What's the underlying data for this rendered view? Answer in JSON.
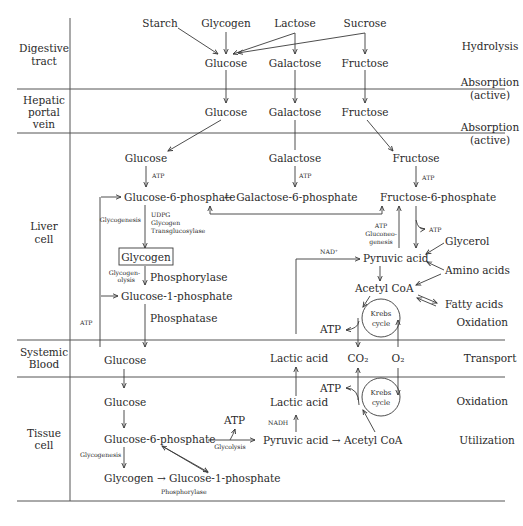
{
  "rows": {
    "digestive": [
      "Digestive",
      "tract"
    ],
    "hepatic": [
      "Hepatic",
      "portal",
      "vein"
    ],
    "liver": [
      "Liver",
      "cell"
    ],
    "blood": [
      "Systemic",
      "Blood"
    ],
    "tissue": [
      "Tissue",
      "cell"
    ]
  },
  "processes": {
    "hydrolysis": "Hydrolysis",
    "absorption1": [
      "Absorption",
      "(active)"
    ],
    "absorption2": [
      "Absorption",
      "(active)"
    ],
    "oxidation_liver": "Oxidation",
    "transport": "Transport",
    "oxidation_tissue": "Oxidation",
    "utilization": "Utilization"
  },
  "digestive": {
    "starch": "Starch",
    "glycogen": "Glycogen",
    "lactose": "Lactose",
    "sucrose": "Sucrose",
    "glucose": "Glucose",
    "galactose": "Galactose",
    "fructose": "Fructose"
  },
  "hepatic": {
    "glucose": "Glucose",
    "galactose": "Galactose",
    "fructose": "Fructose"
  },
  "liver": {
    "glucose": "Glucose",
    "galactose": "Galactose",
    "fructose": "Fructose",
    "atp1": "ATP",
    "atp2": "ATP",
    "atp3": "ATP",
    "g6p": "Glucose-6-phosphate",
    "gal6p": "← Galactose-6-phosphate",
    "f6p": "Fructose-6-phosphate",
    "glycogenesis": "Glycogenesis",
    "enzymes": [
      "UDPG",
      "Glycogen",
      "Transglucosylase"
    ],
    "glycogen_box": "Glycogen",
    "glycogenolysis": [
      "Glycogen-",
      "olysis"
    ],
    "phosphorylase": "Phosphorylase",
    "g1p": "Glucose-1-phosphate",
    "phosphatase": "Phosphatase",
    "atp_left": "ATP",
    "gluconeo": [
      "ATP",
      "Gluconeo-",
      "genesis"
    ],
    "atp_out": "ATP",
    "glycerol": "Glycerol",
    "nad": "NAD⁺",
    "pyruvic": "Pyruvic acid",
    "amino": "Amino acids",
    "acetyl": "Acetyl CoA",
    "fatty": "Fatty acids",
    "krebs": [
      "Krebs",
      "cycle"
    ],
    "atp_krebs": "ATP"
  },
  "blood": {
    "glucose": "Glucose",
    "lactic": "Lactic acid",
    "co2": "CO₂",
    "o2": "O₂"
  },
  "tissue": {
    "glucose": "Glucose",
    "lactic": "Lactic acid",
    "atp_krebs": "ATP",
    "krebs": [
      "Krebs",
      "cycle"
    ],
    "atp_glyco": "ATP",
    "nadh": "NADH",
    "g6p": "Glucose-6-phosphate",
    "glycolysis": "Glycolysis",
    "pyruvic": "Pyruvic acid → Acetyl CoA",
    "glycogenesis": "Glycogenesis",
    "glycogen": "Glycogen → Glucose-1-phosphate",
    "phosphorylase": "Phosphorylase"
  }
}
